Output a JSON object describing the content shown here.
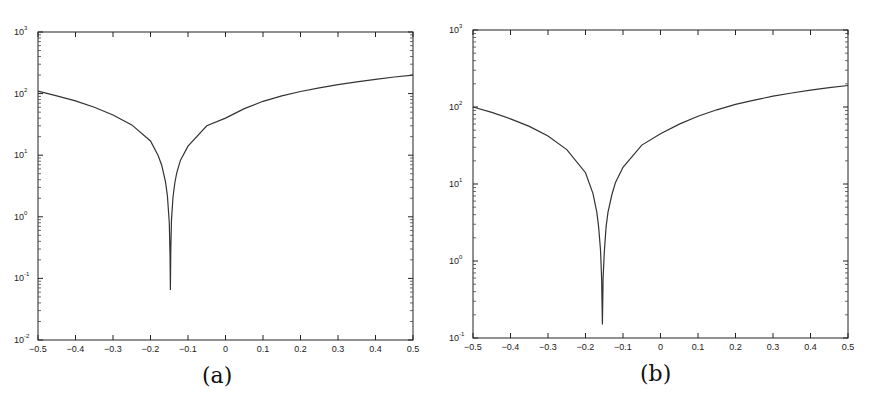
{
  "chart_data": [
    {
      "id": "a",
      "type": "line",
      "caption": "(a)",
      "title": "",
      "xlabel": "",
      "ylabel": "",
      "xscale": "linear",
      "yscale": "log",
      "xlim": [
        -0.5,
        0.5
      ],
      "ylim": [
        0.01,
        1000
      ],
      "xticks": [
        "-0.5",
        "-0.4",
        "-0.3",
        "-0.2",
        "-0.1",
        "0",
        "0.1",
        "0.2",
        "0.3",
        "0.4",
        "0.5"
      ],
      "yticks": [
        "10^-2",
        "10^-1",
        "10^0",
        "10^1",
        "10^2",
        "10^3"
      ],
      "grid": false,
      "legend": null,
      "series": [
        {
          "name": "curve",
          "x": [
            -0.5,
            -0.45,
            -0.4,
            -0.35,
            -0.3,
            -0.25,
            -0.2,
            -0.18,
            -0.17,
            -0.16,
            -0.155,
            -0.15,
            -0.148,
            -0.147,
            -0.146,
            -0.144,
            -0.14,
            -0.135,
            -0.13,
            -0.12,
            -0.1,
            -0.05,
            0,
            0.05,
            0.1,
            0.15,
            0.2,
            0.25,
            0.3,
            0.35,
            0.4,
            0.45,
            0.5
          ],
          "y": [
            110,
            92,
            76,
            60,
            45,
            31,
            17,
            10,
            6.8,
            3.7,
            2.2,
            0.8,
            0.25,
            0.065,
            0.3,
            0.9,
            2.1,
            3.6,
            5.2,
            8.3,
            14,
            30,
            40,
            57,
            75,
            92,
            108,
            124,
            140,
            155,
            170,
            186,
            200
          ]
        }
      ]
    },
    {
      "id": "b",
      "type": "line",
      "caption": "(b)",
      "title": "",
      "xlabel": "",
      "ylabel": "",
      "xscale": "linear",
      "yscale": "log",
      "xlim": [
        -0.5,
        0.5
      ],
      "ylim": [
        0.1,
        1000
      ],
      "xticks": [
        "-0.5",
        "-0.4",
        "-0.3",
        "-0.2",
        "-0.1",
        "0",
        "0.1",
        "0.2",
        "0.3",
        "0.4",
        "0.5"
      ],
      "yticks": [
        "10^-1",
        "10^0",
        "10^1",
        "10^2",
        "10^3"
      ],
      "grid": false,
      "legend": null,
      "series": [
        {
          "name": "curve",
          "x": [
            -0.5,
            -0.45,
            -0.4,
            -0.35,
            -0.3,
            -0.25,
            -0.2,
            -0.18,
            -0.17,
            -0.165,
            -0.16,
            -0.157,
            -0.155,
            -0.153,
            -0.15,
            -0.145,
            -0.14,
            -0.13,
            -0.12,
            -0.1,
            -0.05,
            0,
            0.05,
            0.1,
            0.15,
            0.2,
            0.25,
            0.3,
            0.35,
            0.4,
            0.45,
            0.5
          ],
          "y": [
            100,
            85,
            70,
            56,
            42,
            28,
            14,
            7.5,
            4.3,
            2.8,
            1.4,
            0.6,
            0.15,
            0.6,
            1.3,
            2.8,
            4.3,
            7.2,
            10.5,
            16.5,
            32,
            45,
            60,
            76,
            92,
            108,
            123,
            138,
            152,
            166,
            178,
            190
          ]
        }
      ]
    }
  ],
  "panels": {
    "a": {
      "caption": "(a)",
      "x_tick_labels": [
        "-0.5",
        "-0.4",
        "-0.3",
        "-0.2",
        "-0.1",
        "0",
        "0.1",
        "0.2",
        "0.3",
        "0.4",
        "0.5"
      ],
      "y_tick_labels": [
        {
          "base": "10",
          "exp": "-2"
        },
        {
          "base": "10",
          "exp": "-1"
        },
        {
          "base": "10",
          "exp": "0"
        },
        {
          "base": "10",
          "exp": "1"
        },
        {
          "base": "10",
          "exp": "2"
        },
        {
          "base": "10",
          "exp": "3"
        }
      ]
    },
    "b": {
      "caption": "(b)",
      "x_tick_labels": [
        "-0.5",
        "-0.4",
        "-0.3",
        "-0.2",
        "-0.1",
        "0",
        "0.1",
        "0.2",
        "0.3",
        "0.4",
        "0.5"
      ],
      "y_tick_labels": [
        {
          "base": "10",
          "exp": "-1"
        },
        {
          "base": "10",
          "exp": "0"
        },
        {
          "base": "10",
          "exp": "1"
        },
        {
          "base": "10",
          "exp": "2"
        },
        {
          "base": "10",
          "exp": "3"
        }
      ]
    }
  },
  "colors": {
    "line": "#333333",
    "axes": "#222222",
    "background": "#ffffff"
  }
}
